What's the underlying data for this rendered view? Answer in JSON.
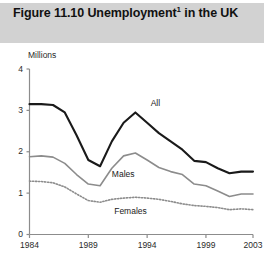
{
  "figure": {
    "title": "Figure 11.10  Unemployment",
    "title_footnote_marker": "1",
    "title_line2": "in the UK"
  },
  "chart_data": {
    "type": "line",
    "subtitle": "",
    "xlabel": "",
    "ylabel": "Millions",
    "unit_label": "Millions",
    "xlim": [
      1984,
      2003
    ],
    "ylim": [
      0,
      4
    ],
    "yticks": [
      0,
      1,
      2,
      3,
      4
    ],
    "ytick_labels": [
      "0",
      "1",
      "2",
      "3",
      "4"
    ],
    "xticks": [
      1984,
      1989,
      1994,
      1999,
      2003
    ],
    "xtick_labels": [
      "1984",
      "1989",
      "1994",
      "1999",
      "2003"
    ],
    "grid": false,
    "legend_position": "inline-labels",
    "x": [
      1984,
      1985,
      1986,
      1987,
      1988,
      1989,
      1990,
      1991,
      1992,
      1993,
      1994,
      1995,
      1996,
      1997,
      1998,
      1999,
      2000,
      2001,
      2002,
      2003
    ],
    "series": [
      {
        "name": "All",
        "label": "All",
        "color": "#1a1a1a",
        "style": "solid",
        "width": 2.1,
        "values": [
          3.15,
          3.15,
          3.13,
          2.95,
          2.4,
          1.8,
          1.65,
          2.25,
          2.7,
          2.95,
          2.7,
          2.45,
          2.25,
          2.05,
          1.78,
          1.75,
          1.6,
          1.48,
          1.52,
          1.52
        ]
      },
      {
        "name": "Males",
        "label": "Males",
        "color": "#8c8c8c",
        "style": "solid",
        "width": 1.6,
        "values": [
          1.88,
          1.9,
          1.87,
          1.72,
          1.45,
          1.22,
          1.18,
          1.6,
          1.9,
          1.97,
          1.8,
          1.62,
          1.52,
          1.45,
          1.22,
          1.18,
          1.05,
          0.92,
          0.98,
          0.98
        ]
      },
      {
        "name": "Females",
        "label": "Females",
        "color": "#8c8c8c",
        "style": "dotted",
        "width": 1.6,
        "values": [
          1.29,
          1.28,
          1.25,
          1.15,
          0.98,
          0.82,
          0.78,
          0.85,
          0.88,
          0.9,
          0.88,
          0.85,
          0.8,
          0.74,
          0.7,
          0.68,
          0.65,
          0.6,
          0.62,
          0.6
        ]
      }
    ],
    "annotations": [
      {
        "text": "All",
        "x": 1994.3,
        "y": 3.15
      },
      {
        "text": "Males",
        "x": 1991.0,
        "y": 1.45
      },
      {
        "text": "Females",
        "x": 1991.2,
        "y": 0.55
      }
    ]
  },
  "axis_colors": {
    "axis_line": "#8c8c8c",
    "title_band": "#d2d2d2",
    "text": "#1a1a1a"
  }
}
